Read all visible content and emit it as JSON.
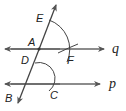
{
  "diagram": {
    "type": "geometry-construction",
    "lines": [
      {
        "id": "q",
        "label": "q",
        "kind": "line"
      },
      {
        "id": "p",
        "label": "p",
        "kind": "line"
      },
      {
        "id": "transversal",
        "label": "",
        "kind": "line",
        "through": [
          "E",
          "A",
          "D",
          "B"
        ]
      }
    ],
    "points": {
      "E": "E",
      "A": "A",
      "D": "D",
      "F": "F",
      "B": "B",
      "C": "C"
    },
    "arcs": [
      {
        "center": "A",
        "from": "E",
        "to": "F"
      },
      {
        "center": "D",
        "to": "C"
      }
    ],
    "colors": {
      "line": "#555555",
      "arc": "#444444",
      "text": "#222222"
    }
  }
}
